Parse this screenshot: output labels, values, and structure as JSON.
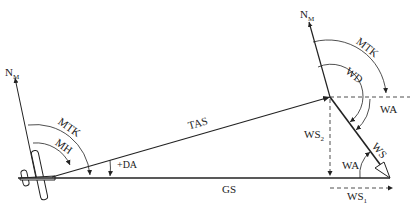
{
  "diagram": {
    "labels": {
      "north_left": "N",
      "north_left_sub": "M",
      "north_right": "N",
      "north_right_sub": "M",
      "mtk_left": "MTK",
      "mh": "MH",
      "da": "+DA",
      "tas": "TAS",
      "gs": "GS",
      "mtk_right": "MTK",
      "wd": "WD",
      "wa_top": "WA",
      "ws2": "WS",
      "ws2_sub": "2",
      "ws": "WS",
      "wa_bottom": "WA",
      "ws1": "WS",
      "ws1_sub": "1"
    },
    "vectors": [
      {
        "name": "TAS",
        "from": "aircraft",
        "to": "wind-origin"
      },
      {
        "name": "WS",
        "from": "wind-origin",
        "to": "gs-end"
      },
      {
        "name": "GS",
        "from": "aircraft",
        "to": "gs-end"
      },
      {
        "name": "WS1",
        "component": "along-track"
      },
      {
        "name": "WS2",
        "component": "cross-track"
      }
    ],
    "colors": {
      "line": "#222222",
      "background": "#ffffff"
    }
  }
}
